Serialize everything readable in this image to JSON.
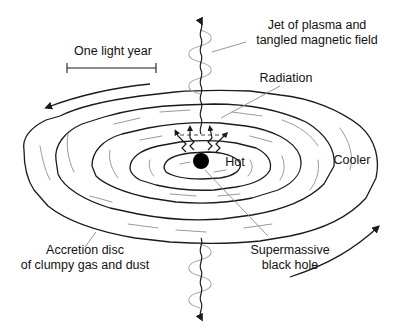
{
  "diagram": {
    "labels": {
      "scale": "One light year",
      "jet_line1": "Jet of plasma and",
      "jet_line2": "tangled magnetic field",
      "radiation": "Radiation",
      "hot": "Hot",
      "cooler": "Cooler",
      "disc_line1": "Accretion disc",
      "disc_line2": "of clumpy gas and dust",
      "bh_line1": "Supermassive",
      "bh_line2": "black hole"
    },
    "colors": {
      "ink": "#1a1a1a",
      "light_stroke": "#9a9a9a",
      "background": "#ffffff",
      "black_hole": "#000000"
    },
    "icons": {
      "rotation_arrows": "curved-arrow-icon",
      "jet_arrows": "arrowhead-icon",
      "radiation_arrows": "zigzag-arrow-icon"
    }
  }
}
